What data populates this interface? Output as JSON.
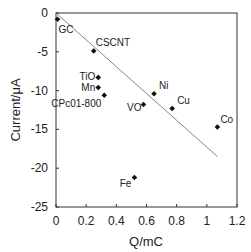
{
  "chart_data": {
    "type": "scatter",
    "title": "",
    "xlabel": "Q/mC",
    "ylabel": "Current/μA",
    "xlim": [
      0,
      1.2
    ],
    "ylim": [
      -25,
      0
    ],
    "x_ticks": [
      "0",
      "0.2",
      "0.4",
      "0.6",
      "0.8",
      "1",
      "1.2"
    ],
    "y_ticks": [
      "0",
      "-5",
      "-10",
      "-15",
      "-20",
      "-25"
    ],
    "grid": false,
    "legend": null,
    "points": [
      {
        "label": "GC",
        "x": 0.01,
        "y": -0.8
      },
      {
        "label": "CSCNT",
        "x": 0.25,
        "y": -4.9
      },
      {
        "label": "TiO",
        "x": 0.28,
        "y": -8.3
      },
      {
        "label": "Mn",
        "x": 0.28,
        "y": -9.6
      },
      {
        "label": "CPc01-800",
        "x": 0.32,
        "y": -10.6
      },
      {
        "label": "VO",
        "x": 0.58,
        "y": -11.8
      },
      {
        "label": "Ni",
        "x": 0.65,
        "y": -10.4
      },
      {
        "label": "Cu",
        "x": 0.77,
        "y": -12.3
      },
      {
        "label": "Co",
        "x": 1.07,
        "y": -14.7
      },
      {
        "label": "Fe",
        "x": 0.52,
        "y": -21.2
      }
    ],
    "trendline": {
      "x": [
        0,
        1.07
      ],
      "y": [
        0,
        -18.5
      ]
    }
  }
}
